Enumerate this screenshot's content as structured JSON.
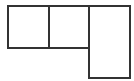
{
  "diagram": {
    "type": "box-layout",
    "stroke_color": "#333333",
    "background": "#ffffff",
    "boxes": [
      {
        "id": "box-1",
        "x": 7,
        "y": 5,
        "w": 43,
        "h": 44
      },
      {
        "id": "box-2",
        "x": 48,
        "y": 5,
        "w": 42,
        "h": 44
      },
      {
        "id": "box-3",
        "x": 88,
        "y": 5,
        "w": 43,
        "h": 74
      }
    ]
  }
}
